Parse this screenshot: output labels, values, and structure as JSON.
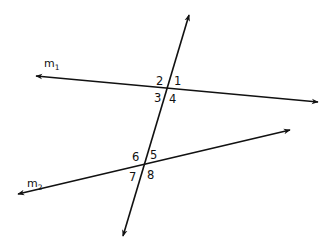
{
  "diagram": {
    "type": "parallel-lines-transversal",
    "colors": {
      "stroke": "#111111",
      "background": "#ffffff"
    },
    "lines": {
      "m1": {
        "name": "m",
        "subscript": "1",
        "x1": 36,
        "y1": 76,
        "x2": 318,
        "y2": 102,
        "label_x": 44,
        "label_y": 67,
        "arrows": "both"
      },
      "m2": {
        "name": "m",
        "subscript": "2",
        "x1": 18,
        "y1": 194,
        "x2": 290,
        "y2": 130,
        "label_x": 27,
        "label_y": 187,
        "arrows": "both"
      },
      "transversal": {
        "x1": 189,
        "y1": 15,
        "x2": 123,
        "y2": 236,
        "arrows": "both"
      }
    },
    "intersections": [
      {
        "name": "m1-transversal",
        "x": 167,
        "y": 87
      },
      {
        "name": "m2-transversal",
        "x": 145,
        "y": 165
      }
    ],
    "angles": [
      {
        "label": "1",
        "x": 174,
        "y": 85
      },
      {
        "label": "2",
        "x": 156,
        "y": 85
      },
      {
        "label": "3",
        "x": 154,
        "y": 102
      },
      {
        "label": "4",
        "x": 169,
        "y": 103
      },
      {
        "label": "5",
        "x": 150,
        "y": 159
      },
      {
        "label": "6",
        "x": 132,
        "y": 161
      },
      {
        "label": "7",
        "x": 129,
        "y": 181
      },
      {
        "label": "8",
        "x": 147,
        "y": 179
      }
    ]
  }
}
